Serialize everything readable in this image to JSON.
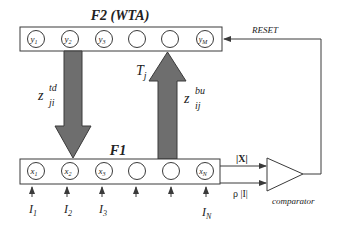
{
  "diagram": {
    "f2": {
      "title": "F2 (WTA)",
      "nodes": [
        {
          "var": "y",
          "sub": "1"
        },
        {
          "var": "y",
          "sub": "2"
        },
        {
          "var": "y",
          "sub": "3"
        },
        {
          "var": "",
          "sub": ""
        },
        {
          "var": "",
          "sub": ""
        },
        {
          "var": "y",
          "sub": "M"
        }
      ]
    },
    "f1": {
      "title": "F1",
      "nodes": [
        {
          "var": "x",
          "sub": "1"
        },
        {
          "var": "x",
          "sub": "2"
        },
        {
          "var": "x",
          "sub": "3"
        },
        {
          "var": "",
          "sub": ""
        },
        {
          "var": "",
          "sub": ""
        },
        {
          "var": "x",
          "sub": "N"
        }
      ]
    },
    "inputs": [
      {
        "var": "I",
        "sub": "1"
      },
      {
        "var": "I",
        "sub": "2"
      },
      {
        "var": "I",
        "sub": "3"
      },
      {
        "var": "",
        "sub": ""
      },
      {
        "var": "",
        "sub": ""
      },
      {
        "var": "I",
        "sub": "N"
      }
    ],
    "top_down": {
      "var": "z",
      "sup": "td",
      "sub": "ji"
    },
    "bottom_up": {
      "var": "z",
      "sup": "bu",
      "sub": "ij"
    },
    "activation": {
      "var": "T",
      "sub": "j"
    },
    "comparator": {
      "label": "comparator",
      "input_top": "|X|",
      "input_bottom": "ρ |I|"
    },
    "reset_label": "RESET",
    "colors": {
      "arrow_fill": "#6e6e6e",
      "stroke": "#3a3a3a",
      "background": "#ffffff"
    }
  }
}
